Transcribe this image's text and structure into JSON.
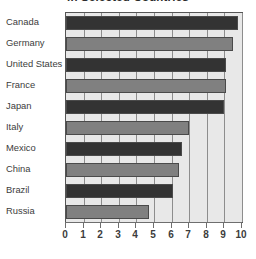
{
  "chart_data": {
    "type": "bar",
    "orientation": "horizontal",
    "title": "in Selected Countries",
    "xlabel": "",
    "ylabel": "",
    "xlim": [
      0,
      10
    ],
    "grid": true,
    "legend": "none",
    "categories": [
      "Canada",
      "Germany",
      "United States",
      "France",
      "Japan",
      "Italy",
      "Mexico",
      "China",
      "Brazil",
      "Russia"
    ],
    "values": [
      9.8,
      9.5,
      9.1,
      9.1,
      9.0,
      7.0,
      6.6,
      6.4,
      6.1,
      4.7
    ],
    "tick_labels": [
      "0",
      "1",
      "2",
      "3",
      "4",
      "5",
      "6",
      "7",
      "8",
      "9",
      "10"
    ],
    "tick_values": [
      0,
      1,
      2,
      3,
      4,
      5,
      6,
      7,
      8,
      9,
      10
    ],
    "bar_styles": [
      "dark",
      "light",
      "dark",
      "light",
      "dark",
      "light",
      "dark",
      "light",
      "dark",
      "light"
    ],
    "colors": {
      "bar_dark": "#333333",
      "bar_light": "#808080",
      "plot_background": "#e8e8e8",
      "gridline": "#8d8d8d",
      "axis": "#6e6e6e",
      "text": "#3c3c3c",
      "page_background": "#ffffff"
    }
  }
}
